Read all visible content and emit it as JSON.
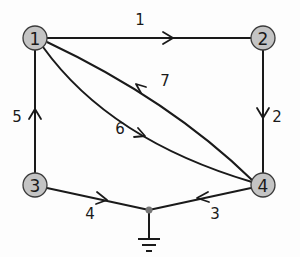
{
  "diagram": {
    "type": "directed-graph-circuit",
    "colors": {
      "node_fill": "#c4c4c4",
      "edge": "#1a1a1a",
      "junction": "#777777"
    },
    "nodes": [
      {
        "id": "1",
        "label": "1",
        "x": 35,
        "y": 38
      },
      {
        "id": "2",
        "label": "2",
        "x": 263,
        "y": 38
      },
      {
        "id": "3",
        "label": "3",
        "x": 35,
        "y": 185
      },
      {
        "id": "4",
        "label": "4",
        "x": 263,
        "y": 185
      }
    ],
    "ground_junction": {
      "x": 149,
      "y": 210
    },
    "edges": [
      {
        "id": "1",
        "label": "1",
        "from": "1",
        "to": "2",
        "label_x": 140,
        "label_y": 20
      },
      {
        "id": "2",
        "label": "2",
        "from": "2",
        "to": "4",
        "label_x": 276,
        "label_y": 117
      },
      {
        "id": "3",
        "label": "3",
        "from": "4",
        "to": "ground",
        "label_x": 215,
        "label_y": 213
      },
      {
        "id": "4",
        "label": "4",
        "from": "3",
        "to": "ground",
        "label_x": 90,
        "label_y": 213
      },
      {
        "id": "5",
        "label": "5",
        "from": "3",
        "to": "1",
        "label_x": 17,
        "label_y": 117
      },
      {
        "id": "6",
        "label": "6",
        "from": "1",
        "to": "4",
        "label_x": 120,
        "label_y": 128
      },
      {
        "id": "7",
        "label": "7",
        "from": "4",
        "to": "1",
        "label_x": 165,
        "label_y": 80
      }
    ]
  }
}
